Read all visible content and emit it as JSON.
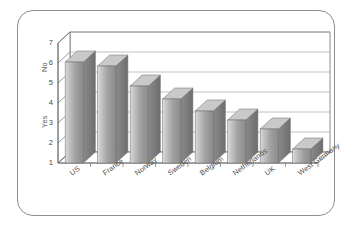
{
  "chart_data": {
    "type": "bar",
    "title": "",
    "subtitle": "",
    "xlabel": "",
    "ylabel": "",
    "axis_titles": {
      "upper": "No",
      "lower": "Yes"
    },
    "categories": [
      "US",
      "France",
      "Norway",
      "Sweden",
      "Belgium",
      "Netherlands",
      "UK",
      "West Germany"
    ],
    "values": [
      6.05,
      5.85,
      4.85,
      4.2,
      3.6,
      3.15,
      2.7,
      1.7
    ],
    "ytick_labels": [
      "1",
      "2",
      "3",
      "4",
      "5",
      "6",
      "7"
    ],
    "yticks": [
      1,
      2,
      3,
      4,
      5,
      6,
      7
    ],
    "ylim": [
      1,
      7
    ],
    "grid": true,
    "legend": false,
    "legend_position": "none",
    "style": "3d-column",
    "colors": {
      "bar_light": "#d8d8d8",
      "bar_mid": "#9a9a9a",
      "bar_dark": "#7b7b7b",
      "bar_top": "#c9c9c9",
      "grid": "#a8a8a8",
      "axis": "#6f6f6f",
      "frame": "#8d8d8d",
      "text": "#4a4a4a",
      "background": "#ffffff"
    }
  }
}
